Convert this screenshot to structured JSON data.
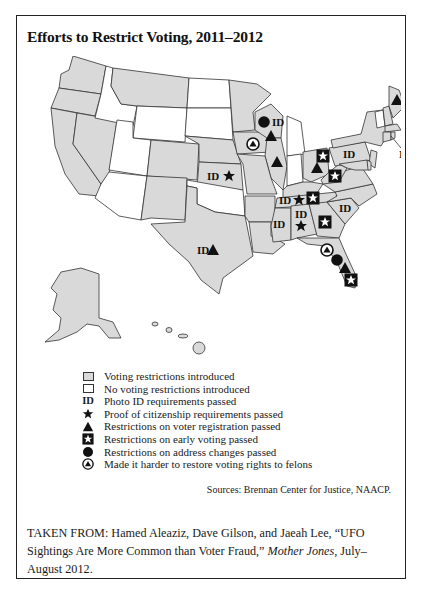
{
  "figure": {
    "title": "Efforts to Restrict Voting, 2011–2012",
    "colors": {
      "restricted_fill": "#d9d9d9",
      "unrestricted_fill": "#ffffff",
      "border": "#333333",
      "symbol": "#111111"
    }
  },
  "map": {
    "restricted_states": [
      "WA",
      "OR",
      "CA",
      "NV",
      "MT",
      "CO",
      "NM",
      "TX",
      "KS",
      "NE",
      "MN",
      "IA",
      "WI",
      "IL",
      "MO",
      "AR",
      "LA",
      "MS",
      "AL",
      "TN",
      "KY",
      "GA",
      "FL",
      "SC",
      "NC",
      "VA",
      "WV",
      "OH",
      "PA",
      "NY",
      "NH",
      "ME",
      "MA",
      "CT",
      "RI",
      "NJ",
      "DE",
      "MD",
      "AK",
      "HI"
    ],
    "unrestricted_states": [
      "ID",
      "WY",
      "UT",
      "AZ",
      "ND",
      "SD",
      "OK",
      "MI",
      "IN",
      "VT"
    ],
    "markers": [
      {
        "state": "WI",
        "symbols": [
          "address",
          "photo_id",
          "registration"
        ]
      },
      {
        "state": "IA",
        "symbols": [
          "felons"
        ]
      },
      {
        "state": "IL",
        "symbols": [
          "registration"
        ]
      },
      {
        "state": "KS",
        "symbols": [
          "photo_id",
          "citizenship"
        ]
      },
      {
        "state": "TX",
        "symbols": [
          "photo_id",
          "registration"
        ]
      },
      {
        "state": "ME",
        "symbols": [
          "registration"
        ]
      },
      {
        "state": "RI",
        "symbols": [
          "photo_id"
        ]
      },
      {
        "state": "PA",
        "symbols": [
          "photo_id"
        ]
      },
      {
        "state": "OH",
        "symbols": [
          "early_voting",
          "registration"
        ]
      },
      {
        "state": "WV",
        "symbols": [
          "early_voting"
        ]
      },
      {
        "state": "TN",
        "symbols": [
          "photo_id",
          "citizenship",
          "early_voting"
        ]
      },
      {
        "state": "MS",
        "symbols": [
          "photo_id"
        ]
      },
      {
        "state": "AL",
        "symbols": [
          "photo_id",
          "citizenship"
        ]
      },
      {
        "state": "GA",
        "symbols": [
          "early_voting"
        ]
      },
      {
        "state": "SC",
        "symbols": [
          "photo_id"
        ]
      },
      {
        "state": "FL",
        "symbols": [
          "felons",
          "address",
          "registration",
          "early_voting"
        ]
      }
    ],
    "id_label": "ID"
  },
  "legend": {
    "items": [
      {
        "symbol": "restricted-swatch",
        "label": "Voting restrictions introduced"
      },
      {
        "symbol": "unrestricted-swatch",
        "label": "No voting restrictions introduced"
      },
      {
        "symbol": "ID",
        "label": "Photo ID requirements passed"
      },
      {
        "symbol": "star",
        "label": "Proof of citizenship requirements passed"
      },
      {
        "symbol": "triangle",
        "label": "Restrictions on voter registration passed"
      },
      {
        "symbol": "boxed-star",
        "label": "Restrictions on early voting passed"
      },
      {
        "symbol": "circle",
        "label": "Restrictions on address changes passed"
      },
      {
        "symbol": "circled-triangle",
        "label": "Made it harder to restore voting rights to felons"
      }
    ]
  },
  "sources": "Sources: Brennan Center for Justice, NAACP.",
  "citation": {
    "prefix": "TAKEN FROM: Hamed Aleaziz, Dave Gilson, and Jaeah Lee, “UFO Sightings Are More Common than Voter Fraud,” ",
    "publication": "Mother Jones",
    "suffix": ", July–August 2012."
  }
}
